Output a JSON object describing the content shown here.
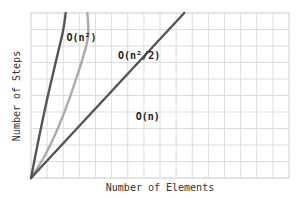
{
  "chart_data": {
    "type": "line",
    "title": "",
    "xlabel": "Number of Elements",
    "ylabel": "Number of Steps",
    "grid": true,
    "legend": "inline-annotations",
    "x_range": [
      0,
      16
    ],
    "y_range": [
      0,
      10
    ],
    "series": [
      {
        "name": "O(n²)",
        "color": "#555555",
        "label_pos": [
          2.2,
          8.3
        ],
        "points": [
          [
            0,
            0
          ],
          [
            0.5,
            2.5
          ],
          [
            1.0,
            4.8
          ],
          [
            1.5,
            6.9
          ],
          [
            2.0,
            8.9
          ],
          [
            2.15,
            10
          ]
        ]
      },
      {
        "name": "O(n²/2)",
        "color": "#aaaaaa",
        "label_pos": [
          5.4,
          7.2
        ],
        "points": [
          [
            0,
            0
          ],
          [
            0.8,
            1.2
          ],
          [
            1.6,
            2.8
          ],
          [
            2.4,
            4.8
          ],
          [
            3.2,
            7.2
          ],
          [
            3.6,
            8.6
          ],
          [
            3.5,
            10
          ]
        ]
      },
      {
        "name": "O(n)",
        "color": "#555555",
        "label_pos": [
          6.5,
          3.5
        ],
        "points": [
          [
            0,
            0
          ],
          [
            9.5,
            10
          ]
        ]
      }
    ]
  },
  "plot": {
    "left": 31,
    "top": 13,
    "right": 289,
    "bottom": 178,
    "cols": 16,
    "rows": 10,
    "grid_color": "#dddddd",
    "border_color": "#cccccc"
  }
}
